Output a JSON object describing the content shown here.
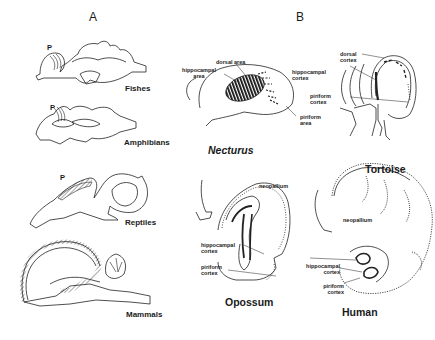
{
  "panels": {
    "A": {
      "letter": "A",
      "p_marker": "P",
      "species": [
        "Fishes",
        "Amphibians",
        "Reptiles",
        "Mammals"
      ]
    },
    "B": {
      "letter": "B",
      "necturus": {
        "name": "Necturus",
        "labels": {
          "dorsal_area": "dorsal area",
          "hippocampal_area_1": "hippocampal",
          "hippocampal_area_2": "area",
          "piriform_area_1": "piriform",
          "piriform_area_2": "area"
        }
      },
      "tortoise": {
        "name": "Tortoise",
        "labels": {
          "dorsal_cortex_1": "dorsal",
          "dorsal_cortex_2": "cortex",
          "hippocampal_cortex_1": "hippocampal",
          "hippocampal_cortex_2": "cortex",
          "piriform_cortex_1": "piriform",
          "piriform_cortex_2": "cortex"
        }
      },
      "opossum": {
        "name": "Opossum",
        "labels": {
          "neopallium": "neopallium",
          "hippocampal_cortex_1": "hippocampal",
          "hippocampal_cortex_2": "cortex",
          "piriform_cortex_1": "piriform",
          "piriform_cortex_2": "cortex"
        }
      },
      "human": {
        "name": "Human",
        "labels": {
          "neopallium": "neopallium",
          "hippocampal_cortex_1": "hippocampal",
          "hippocampal_cortex_2": "cortex",
          "piriform_cortex_1": "piriform",
          "piriform_cortex_2": "cortex"
        }
      }
    }
  }
}
